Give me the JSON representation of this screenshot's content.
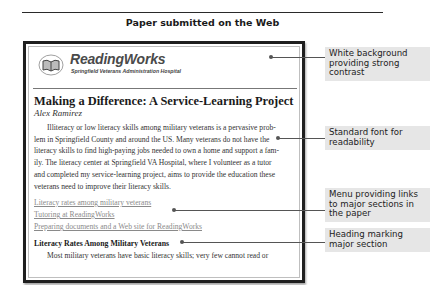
{
  "figure": {
    "title": "Paper submitted on the Web"
  },
  "page": {
    "brand": {
      "name": "ReadingWorks",
      "subtitle": "Springfield Veterans Administration Hospital",
      "logo_icon": "open-book-icon"
    },
    "paper_title": "Making a Difference: A Service-Learning Project",
    "author": "Alex Ramirez",
    "paragraph_lines": [
      "Illiteracy or low literacy skills among military veterans is a pervasive prob-",
      "lem in Springfield County and around the US. Many veterans do not have the",
      "literacy skills to find high-paying jobs needed to own a home and support a fam-",
      "ily. The literacy center at Springfield VA Hospital, where I volunteer as a tutor",
      "and completed my service-learning project, aims to provide the education these",
      "veterans need to improve their literacy skills."
    ],
    "menu_links": [
      "Literacy rates among military veterans",
      "Tutoring at ReadingWorks",
      "Preparing documents and a Web site for ReadingWorks"
    ],
    "section_heading": "Literacy Rates Among Military Veterans",
    "section_text": "Most military veterans have basic literacy skills; very few cannot read or"
  },
  "callouts": [
    "White background providing strong contrast",
    "Standard font for readability",
    "Menu providing links to major sections in the paper",
    "Heading marking major section"
  ]
}
